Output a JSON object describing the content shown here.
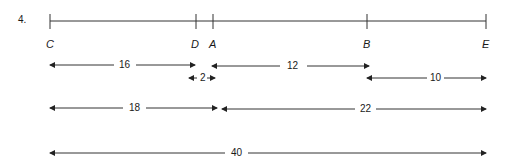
{
  "problem": {
    "number": "4."
  },
  "points": [
    {
      "label": "C",
      "x": 50
    },
    {
      "label": "D",
      "x": 196
    },
    {
      "label": "A",
      "x": 213
    },
    {
      "label": "B",
      "x": 367
    },
    {
      "label": "E",
      "x": 486
    }
  ],
  "segments": [
    {
      "label": "16",
      "from": "C",
      "to": "D",
      "y": 65
    },
    {
      "label": "2",
      "from": "D",
      "to": "A",
      "y": 78
    },
    {
      "label": "12",
      "from": "A",
      "to": "B",
      "y": 66
    },
    {
      "label": "10",
      "from": "B",
      "to": "E",
      "y": 78
    },
    {
      "label": "18",
      "from": "C",
      "to": "A",
      "y": 108
    },
    {
      "label": "22",
      "from": "A",
      "to": "E",
      "y": 109
    },
    {
      "label": "40",
      "from": "C",
      "to": "E",
      "y": 153
    }
  ],
  "colors": {
    "line": "#333333",
    "text": "#1a1a1a"
  }
}
